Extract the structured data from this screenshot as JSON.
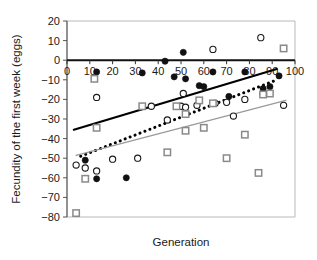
{
  "chart_data": {
    "type": "scatter",
    "title": "",
    "xlabel": "Generation",
    "ylabel": "Fecundity of the first week (eggs)",
    "xlim": [
      0,
      100
    ],
    "ylim": [
      -80,
      20
    ],
    "xticks": [
      0,
      10,
      20,
      30,
      40,
      50,
      60,
      70,
      80,
      90,
      100
    ],
    "yticks": [
      20,
      10,
      0,
      -10,
      -20,
      -30,
      -40,
      -50,
      -60,
      -70,
      -80
    ],
    "grid": false,
    "legend": "none",
    "x_axis_position": "zero",
    "series": [
      {
        "name": "filled-circle",
        "marker": "filled-circle",
        "color": "#000000",
        "points": [
          [
            13,
            -6
          ],
          [
            33,
            -6.5
          ],
          [
            43,
            -0.5
          ],
          [
            47,
            -8.5
          ],
          [
            51,
            4
          ],
          [
            52,
            -9.5
          ],
          [
            58,
            -13
          ],
          [
            60,
            -13.5
          ],
          [
            64,
            -6
          ],
          [
            71,
            -18.5
          ],
          [
            78,
            -6
          ],
          [
            86,
            -14.5
          ],
          [
            89,
            -13.5
          ],
          [
            93,
            -8
          ],
          [
            8,
            -51
          ],
          [
            13,
            -60.5
          ],
          [
            26,
            -60
          ]
        ]
      },
      {
        "name": "open-circle",
        "marker": "open-circle",
        "color": "#000000",
        "points": [
          [
            13,
            -19
          ],
          [
            51,
            -17
          ],
          [
            50,
            -23.5
          ],
          [
            52,
            -24
          ],
          [
            57,
            -23
          ],
          [
            64,
            5.5
          ],
          [
            65,
            -22
          ],
          [
            70,
            -21.5
          ],
          [
            73,
            -28.5
          ],
          [
            78,
            -20
          ],
          [
            85,
            11.5
          ],
          [
            86,
            -17
          ],
          [
            95,
            -23
          ],
          [
            44,
            -30.5
          ],
          [
            4,
            -53.5
          ],
          [
            8,
            -55
          ],
          [
            13,
            -56.5
          ],
          [
            20,
            -50.5
          ],
          [
            31,
            -50
          ],
          [
            37,
            -23.5
          ]
        ]
      },
      {
        "name": "gray-square",
        "marker": "gray-square",
        "color": "#808080",
        "points": [
          [
            12,
            -9.5
          ],
          [
            13,
            -34.5
          ],
          [
            33,
            -23.5
          ],
          [
            48,
            -23.5
          ],
          [
            52,
            -27.5
          ],
          [
            52,
            -36
          ],
          [
            58,
            -20.5
          ],
          [
            60,
            -34.5
          ],
          [
            64,
            -22
          ],
          [
            70,
            -50
          ],
          [
            78,
            -38
          ],
          [
            84,
            -57.5
          ],
          [
            86,
            -17.5
          ],
          [
            89,
            -17
          ],
          [
            95,
            6
          ],
          [
            8,
            -60.5
          ],
          [
            4,
            -78
          ],
          [
            44,
            -47
          ]
        ]
      }
    ],
    "trendlines": [
      {
        "name": "solid-black-line",
        "style": "solid",
        "color": "#000000",
        "width": 2.2,
        "x0": 3,
        "y0": -35.5,
        "x1": 92,
        "y1": -4.5
      },
      {
        "name": "dotted-black-line",
        "style": "dotted",
        "color": "#000000",
        "width": 2.2,
        "x0": 6,
        "y0": -49,
        "x1": 91,
        "y1": -10.5
      },
      {
        "name": "solid-gray-line",
        "style": "solid",
        "color": "#9a9a9a",
        "width": 1.3,
        "x0": 4,
        "y0": -48.5,
        "x1": 96,
        "y1": -20.5
      }
    ]
  }
}
